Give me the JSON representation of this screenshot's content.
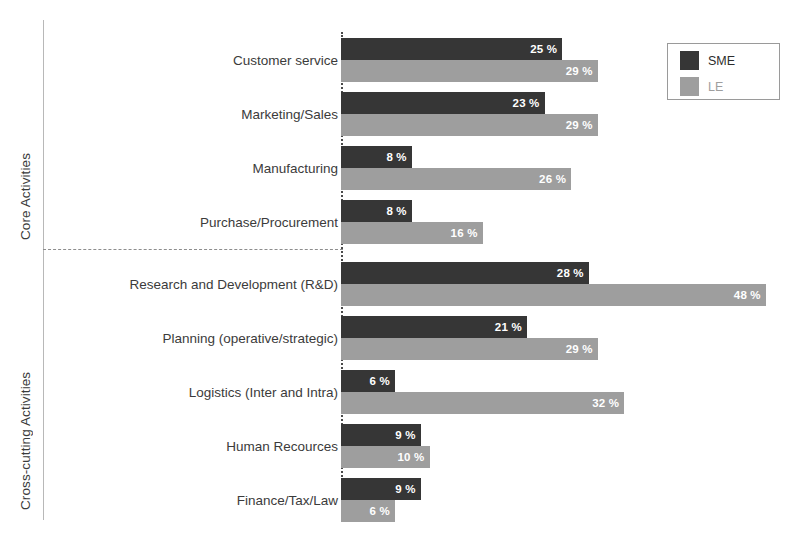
{
  "chart_data": {
    "type": "bar",
    "orientation": "horizontal",
    "title": "",
    "xlabel": "",
    "ylabel": "",
    "xlim": [
      0,
      50
    ],
    "grid": false,
    "legend_position": "top-right",
    "value_suffix": " %",
    "categories": [
      "Customer service",
      "Marketing/Sales",
      "Manufacturing",
      "Purchase/Procurement",
      "Research and Development (R&D)",
      "Planning (operative/strategic)",
      "Logistics (Inter and Intra)",
      "Human Recources",
      "Finance/Tax/Law"
    ],
    "series": [
      {
        "name": "SME",
        "color": "#363636",
        "values": [
          25,
          23,
          8,
          8,
          28,
          21,
          6,
          9,
          9
        ]
      },
      {
        "name": "LE",
        "color": "#9e9e9e",
        "values": [
          29,
          29,
          26,
          16,
          48,
          29,
          32,
          10,
          6
        ]
      }
    ],
    "groups": [
      {
        "label": "Core Activities",
        "categories": [
          0,
          1,
          2,
          3
        ]
      },
      {
        "label": "Cross-cutting Activities",
        "categories": [
          4,
          5,
          6,
          7,
          8
        ]
      }
    ],
    "data_labels": [
      {
        "category": "Customer service",
        "sme": "25 %",
        "le": "29 %"
      },
      {
        "category": "Marketing/Sales",
        "sme": "23 %",
        "le": "29 %"
      },
      {
        "category": "Manufacturing",
        "sme": "8 %",
        "le": "26 %"
      },
      {
        "category": "Purchase/Procurement",
        "sme": "8 %",
        "le": "16 %"
      },
      {
        "category": "Research and Development (R&D)",
        "sme": "28 %",
        "le": "48 %"
      },
      {
        "category": "Planning (operative/strategic)",
        "sme": "21 %",
        "le": "29 %"
      },
      {
        "category": "Logistics (Inter and Intra)",
        "sme": "6 %",
        "le": "32 %"
      },
      {
        "category": "Human Recources",
        "sme": "9 %",
        "le": "10 %"
      },
      {
        "category": "Finance/Tax/Law",
        "sme": "9 %",
        "le": "6 %"
      }
    ]
  },
  "legend": {
    "items": [
      {
        "label": "SME",
        "color": "#363636"
      },
      {
        "label": "LE",
        "color": "#9e9e9e"
      }
    ]
  },
  "axis": {
    "group_labels": {
      "core": "Core Activities",
      "cross_cutting": "Cross-cutting Activities"
    }
  },
  "style": {
    "background": "#ffffff",
    "sme_color": "#363636",
    "le_color": "#9e9e9e",
    "axis_color": "#4a4a4a",
    "text_color": "#3b3b3b"
  }
}
